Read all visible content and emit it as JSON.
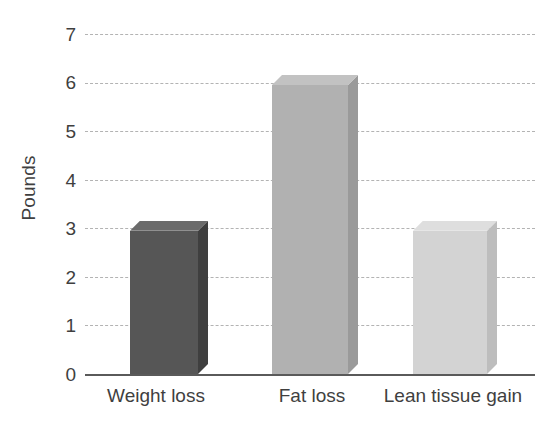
{
  "chart_data": {
    "type": "bar",
    "title": "",
    "subtitle": "",
    "xlabel": "",
    "ylabel": "Pounds",
    "categories": [
      "Weight loss",
      "Fat loss",
      "Lean tissue gain"
    ],
    "values": [
      2.95,
      5.95,
      2.95
    ],
    "series": [
      {
        "name": "Pounds",
        "values": [
          2.95,
          5.95,
          2.95
        ]
      }
    ],
    "ylim": [
      0,
      7
    ],
    "ytick_labels": [
      "0",
      "1",
      "2",
      "3",
      "4",
      "5",
      "6",
      "7"
    ],
    "ytick_values": [
      0,
      1,
      2,
      3,
      4,
      5,
      6,
      7
    ],
    "grid": true,
    "grid_style": "dashed",
    "grid_axis": "y",
    "legend": false,
    "legend_position": "none",
    "style": "3d-bars",
    "bar_colors": [
      "#565656",
      "#b1b1b1",
      "#d3d3d3"
    ],
    "bar_side_colors": [
      "#3f3f3f",
      "#9a9a9a",
      "#bdbdbd"
    ],
    "bar_top_colors": [
      "#6b6b6b",
      "#c2c2c2",
      "#dedede"
    ],
    "axis_color": "#5a5a5a",
    "grid_color": "#b3b3b3",
    "text_color": "#3f3f3f",
    "background": "#ffffff"
  },
  "axes": {
    "y_title": "Pounds",
    "y_ticks": [
      {
        "label": "7",
        "value": 7,
        "top": 25
      },
      {
        "label": "6",
        "value": 6,
        "top": 73
      },
      {
        "label": "5",
        "value": 5,
        "top": 122
      },
      {
        "label": "4",
        "value": 4,
        "top": 171
      },
      {
        "label": "3",
        "value": 3,
        "top": 219
      },
      {
        "label": "2",
        "value": 2,
        "top": 268
      },
      {
        "label": "1",
        "value": 1,
        "top": 316
      },
      {
        "label": "0",
        "value": 0,
        "top": 365
      }
    ]
  },
  "bars": [
    {
      "label": "Weight loss",
      "value": 2.95,
      "label_center": 156
    },
    {
      "label": "Fat loss",
      "value": 5.95,
      "label_center": 312
    },
    {
      "label": "Lean tissue gain",
      "value": 2.95,
      "label_center": 453
    }
  ]
}
